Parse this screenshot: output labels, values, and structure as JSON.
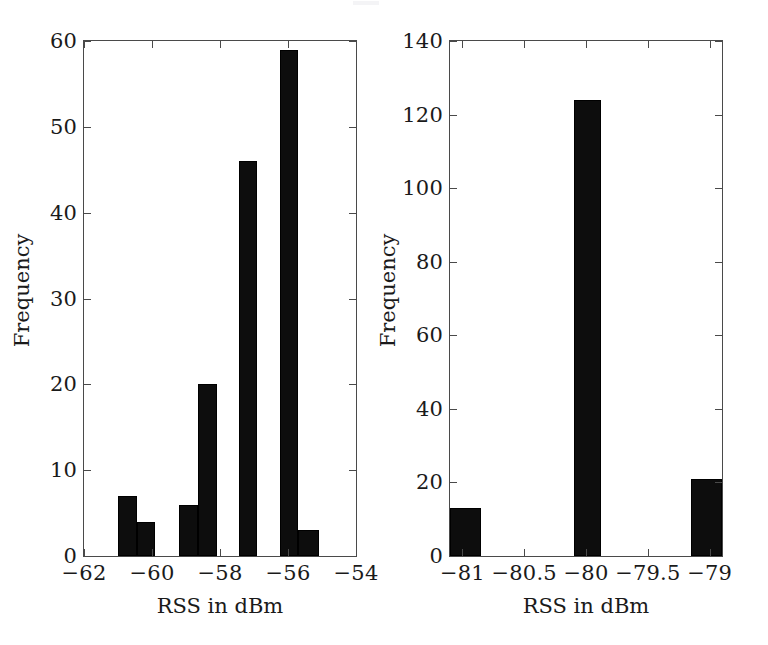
{
  "figure": {
    "width": 768,
    "height": 645,
    "background": "#ffffff",
    "bar_color": "#0d0d0d",
    "axis_color": "#4a4a4a",
    "text_color": "#1a1a1a"
  },
  "panels": [
    {
      "id": "left",
      "ytitle": "Frequency",
      "xtitle": "RSS in dBm"
    },
    {
      "id": "right",
      "ytitle": "Frequency",
      "xtitle": "RSS in dBm"
    }
  ],
  "chart_data": [
    {
      "type": "bar",
      "id": "rss-histogram-left",
      "title": "",
      "xlabel": "RSS in dBm",
      "ylabel": "Frequency",
      "xlim": [
        -62,
        -54
      ],
      "ylim": [
        0,
        60
      ],
      "xticks": [
        -62,
        -60,
        -58,
        -56,
        -54
      ],
      "xticklabels": [
        "−62",
        "−60",
        "−58",
        "−56",
        "−54"
      ],
      "yticks": [
        0,
        10,
        20,
        30,
        40,
        50,
        60
      ],
      "yticklabels": [
        "0",
        "10",
        "20",
        "30",
        "40",
        "50",
        "60"
      ],
      "grid": false,
      "legend": null,
      "bin_width": 0.55,
      "bins": [
        {
          "x0": -61.0,
          "x1": -60.45,
          "value": 7
        },
        {
          "x0": -60.45,
          "x1": -59.9,
          "value": 4
        },
        {
          "x0": -59.2,
          "x1": -58.65,
          "value": 6
        },
        {
          "x0": -58.65,
          "x1": -58.1,
          "value": 20
        },
        {
          "x0": -57.45,
          "x1": -56.9,
          "value": 46
        },
        {
          "x0": -56.25,
          "x1": -55.7,
          "value": 59
        },
        {
          "x0": -55.7,
          "x1": -55.1,
          "value": 3
        }
      ],
      "categories": [
        "−60.7",
        "−60.2",
        "−58.9",
        "−58.4",
        "−57.2",
        "−56.0",
        "−55.4"
      ],
      "values": [
        7,
        4,
        6,
        20,
        46,
        59,
        3
      ]
    },
    {
      "type": "bar",
      "id": "rss-histogram-right",
      "title": "",
      "xlabel": "RSS in dBm",
      "ylabel": "Frequency",
      "xlim": [
        -81.1,
        -78.9
      ],
      "ylim": [
        0,
        140
      ],
      "xticks": [
        -81,
        -80.5,
        -80,
        -79.5,
        -79
      ],
      "xticklabels": [
        "−81",
        "−80.5",
        "−80",
        "−79.5",
        "−79"
      ],
      "yticks": [
        0,
        20,
        40,
        60,
        80,
        100,
        120,
        140
      ],
      "yticklabels": [
        "0",
        "20",
        "40",
        "60",
        "80",
        "100",
        "120",
        "140"
      ],
      "grid": false,
      "legend": null,
      "bin_width": 0.2,
      "bins": [
        {
          "x0": -81.1,
          "x1": -80.85,
          "value": 13
        },
        {
          "x0": -80.1,
          "x1": -79.88,
          "value": 124
        },
        {
          "x0": -79.15,
          "x1": -78.9,
          "value": 21
        }
      ],
      "categories": [
        "−81",
        "−80",
        "−79"
      ],
      "values": [
        13,
        124,
        21
      ]
    }
  ]
}
